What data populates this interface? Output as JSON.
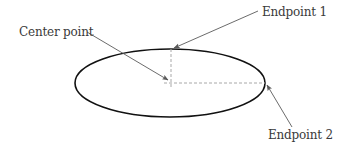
{
  "diagram": {
    "labels": {
      "center_point": "Center point",
      "endpoint_1": "Endpoint 1",
      "endpoint_2": "Endpoint 2"
    },
    "colors": {
      "ellipse_stroke": "#111111",
      "arrow": "#5a5a5a",
      "dashed": "#a8a8a8",
      "text": "#3a3a3a"
    },
    "ellipse": {
      "cx": 170,
      "cy": 83,
      "rx": 95,
      "ry": 34
    }
  }
}
